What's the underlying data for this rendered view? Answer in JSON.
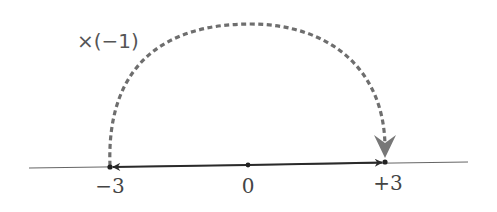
{
  "diagram": {
    "operation_label": "×(−1)",
    "number_line": {
      "ticks": [
        {
          "value": -3,
          "label": "−3"
        },
        {
          "value": 0,
          "label": "0"
        },
        {
          "value": 3,
          "label": "+3"
        }
      ]
    },
    "vectors": [
      {
        "from": 0,
        "to": -3,
        "style": "solid",
        "description": "arrow from 0 to -3"
      },
      {
        "from": 0,
        "to": 3,
        "style": "solid",
        "description": "arrow from 0 to +3"
      }
    ],
    "transform_arc": {
      "from": -3,
      "to": 3,
      "style": "dashed",
      "label": "×(−1)"
    },
    "colors": {
      "axis": "#555555",
      "vector": "#333333",
      "arc": "#6b6b6b",
      "points": "#222222"
    }
  }
}
